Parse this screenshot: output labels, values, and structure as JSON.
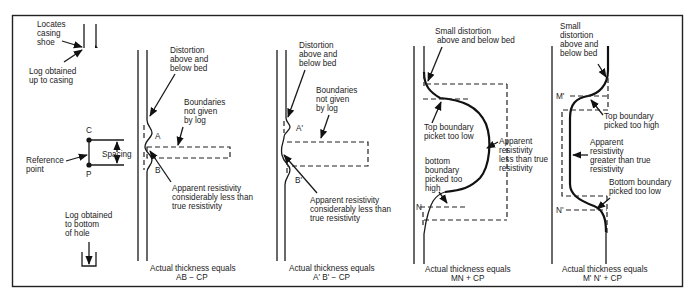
{
  "figure": {
    "legend_panel": {
      "casing_label": "Locates",
      "casing_label_2": "casing",
      "casing_label_3": "shoe",
      "log_top_1": "Log obtained",
      "log_top_2": "up to casing",
      "point_c": "C",
      "point_p": "P",
      "spacing": "Spacing",
      "reference_1": "Reference",
      "reference_2": "point",
      "log_bottom_1": "Log obtained",
      "log_bottom_2": "to bottom",
      "log_bottom_3": "of hole"
    },
    "panels": [
      {
        "distortion": [
          "Distortion",
          "above and",
          "below bed"
        ],
        "boundaries": [
          "Boundaries",
          "not given",
          "by log"
        ],
        "top_label": "A",
        "bottom_label": "B",
        "apparent": [
          "Apparent resistivity",
          "considerably less than",
          "true resistivity"
        ],
        "caption_1": "Actual thickness equals",
        "caption_2": "AB − CP"
      },
      {
        "distortion": [
          "Distortion",
          "above and",
          "below bed"
        ],
        "boundaries": [
          "Boundaries",
          "not given",
          "by log"
        ],
        "top_label": "A'",
        "bottom_label": "B'",
        "apparent": [
          "Apparent resistivity",
          "considerably less than",
          "true resistivity"
        ],
        "caption_1": "Actual thickness equals",
        "caption_2": "A' B' − CP"
      },
      {
        "distortion": [
          "Small distortion",
          "above and below bed"
        ],
        "top_boundary": [
          "Top boundary",
          "picket too low"
        ],
        "bottom_boundary": [
          "bottom",
          "boundary",
          "picked too",
          "high"
        ],
        "bottom_label": "N",
        "apparent": [
          "Apparent",
          "resistivity",
          "less than true",
          "resistivity"
        ],
        "caption_1": "Actual thickness equals",
        "caption_2": "MN + CP"
      },
      {
        "distortion": [
          "Small",
          "distortion",
          "above and",
          "below bed"
        ],
        "top_label": "M'",
        "bottom_label": "N'",
        "top_boundary": [
          "Top boundary",
          "picked too high"
        ],
        "apparent": [
          "Apparent",
          "resistivity",
          "greater than true",
          "resistivity"
        ],
        "bottom_boundary": [
          "Bottom boundary",
          "picked too low"
        ],
        "caption_1": "Actual thickness equals",
        "caption_2": "M' N' + CP"
      }
    ]
  }
}
